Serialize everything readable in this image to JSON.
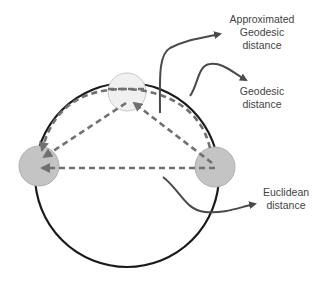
{
  "diagram": {
    "labels": {
      "approx_geodesic": [
        "Approximated",
        "Geodesic",
        "distance"
      ],
      "geodesic": [
        "Geodesic",
        "distance"
      ],
      "euclidean": [
        "Euclidean",
        "distance"
      ]
    },
    "nodes": [
      {
        "id": "top",
        "fill": "#f0f0f0"
      },
      {
        "id": "left",
        "fill": "#c4c4c4"
      },
      {
        "id": "right",
        "fill": "#c4c4c4"
      }
    ],
    "colors": {
      "manifold": "#1a1a1a",
      "dashed": "#707070",
      "arrow": "#4a4a4a",
      "text": "#444444"
    }
  }
}
